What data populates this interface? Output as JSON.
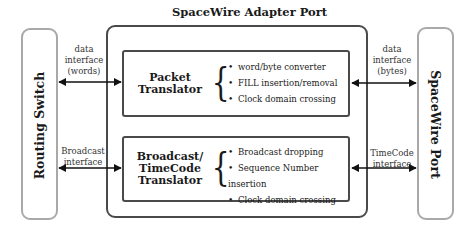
{
  "diagram": {
    "title": "SpaceWire Adapter Port",
    "left_node": {
      "label": "Routing Switch"
    },
    "right_node": {
      "label": "SpaceWire Port"
    },
    "blocks": [
      {
        "title_lines": [
          "Packet",
          "Translator"
        ],
        "features": [
          "word/byte converter",
          "FILL insertion/removal",
          "Clock domain crossing"
        ],
        "left_interface": [
          "data",
          "interface",
          "(words)"
        ],
        "right_interface": [
          "data",
          "interface",
          "(bytes)"
        ]
      },
      {
        "title_lines": [
          "Broadcast/",
          "TimeCode",
          "Translator"
        ],
        "features": [
          "Broadcast dropping",
          "Sequence Number insertion",
          "Clock domain crossing"
        ],
        "left_interface": [
          "Broadcast",
          "interface"
        ],
        "right_interface": [
          "TimeCode",
          "interface"
        ]
      }
    ],
    "colors": {
      "side_box_border": "#a9a9a9",
      "box_border": "#4a4a4a",
      "text": "#1a1a1a"
    }
  }
}
